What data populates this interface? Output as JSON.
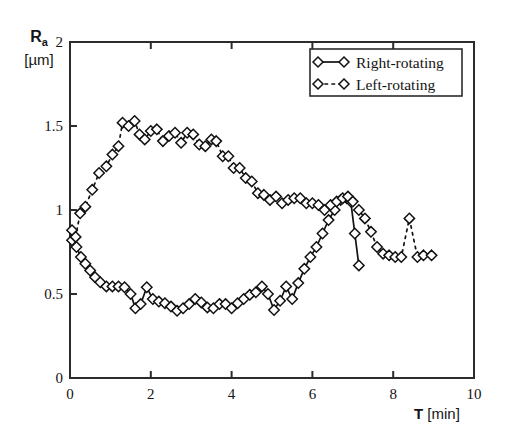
{
  "chart_data": {
    "type": "line",
    "title": "",
    "xlabel": "T [min]",
    "ylabel": "Ra [µm]",
    "ylabel_symbol": "R",
    "ylabel_subscript": "a",
    "ylabel_units": "[µm]",
    "xlabel_symbol": "T",
    "xlabel_units": "[min]",
    "xlim": [
      0,
      10
    ],
    "ylim": [
      0,
      2
    ],
    "xticks": [
      0,
      2,
      4,
      6,
      8,
      10
    ],
    "xtick_labels": [
      "0",
      "2",
      "4",
      "6",
      "8",
      "10"
    ],
    "yticks": [
      0,
      0.5,
      1,
      1.5,
      2
    ],
    "ytick_labels": [
      "0",
      "0.5",
      "1",
      "1.5",
      "2"
    ],
    "grid": false,
    "legend_position": "top-right",
    "marker": "diamond",
    "series": [
      {
        "name": "Right-rotating",
        "linestyle": "solid",
        "color": "#111111",
        "x": [
          0.05,
          0.16,
          0.27,
          0.38,
          0.5,
          0.62,
          0.75,
          0.9,
          1.05,
          1.2,
          1.35,
          1.5,
          1.62,
          1.75,
          1.9,
          2.05,
          2.2,
          2.35,
          2.5,
          2.65,
          2.8,
          2.95,
          3.1,
          3.25,
          3.4,
          3.55,
          3.7,
          3.85,
          4.0,
          4.15,
          4.3,
          4.45,
          4.6,
          4.75,
          4.9,
          5.05,
          5.2,
          5.35,
          5.5,
          5.65,
          5.8,
          5.95,
          6.1,
          6.25,
          6.4,
          6.55,
          6.7,
          6.85,
          6.95,
          7.05,
          7.15
        ],
        "y": [
          0.82,
          0.78,
          0.72,
          0.68,
          0.64,
          0.6,
          0.57,
          0.545,
          0.545,
          0.545,
          0.54,
          0.5,
          0.415,
          0.44,
          0.54,
          0.47,
          0.455,
          0.445,
          0.425,
          0.4,
          0.415,
          0.44,
          0.47,
          0.45,
          0.42,
          0.415,
          0.44,
          0.44,
          0.415,
          0.445,
          0.47,
          0.495,
          0.51,
          0.545,
          0.5,
          0.405,
          0.46,
          0.545,
          0.47,
          0.565,
          0.65,
          0.72,
          0.78,
          0.86,
          0.94,
          1.0,
          1.06,
          1.07,
          1.05,
          0.86,
          0.67
        ]
      },
      {
        "name": "Left-rotating",
        "linestyle": "dashed",
        "color": "#111111",
        "x": [
          0.05,
          0.14,
          0.25,
          0.38,
          0.55,
          0.72,
          0.9,
          1.05,
          1.2,
          1.3,
          1.45,
          1.6,
          1.72,
          1.85,
          2.0,
          2.15,
          2.3,
          2.45,
          2.6,
          2.75,
          2.9,
          3.05,
          3.2,
          3.35,
          3.5,
          3.62,
          3.78,
          3.92,
          4.05,
          4.2,
          4.35,
          4.5,
          4.65,
          4.8,
          4.95,
          5.1,
          5.25,
          5.4,
          5.55,
          5.7,
          5.85,
          6.0,
          6.15,
          6.3,
          6.45,
          6.6,
          6.75,
          6.88,
          7.0,
          7.15,
          7.3,
          7.45,
          7.6,
          7.75,
          7.9,
          8.05,
          8.2,
          8.4,
          8.6,
          8.75,
          8.95
        ],
        "y": [
          0.88,
          0.84,
          0.98,
          1.02,
          1.12,
          1.22,
          1.26,
          1.33,
          1.38,
          1.52,
          1.5,
          1.53,
          1.45,
          1.42,
          1.47,
          1.48,
          1.41,
          1.44,
          1.46,
          1.4,
          1.46,
          1.45,
          1.39,
          1.38,
          1.42,
          1.41,
          1.32,
          1.32,
          1.25,
          1.25,
          1.19,
          1.17,
          1.1,
          1.09,
          1.06,
          1.08,
          1.04,
          1.06,
          1.07,
          1.07,
          1.04,
          1.04,
          1.03,
          1.0,
          1.03,
          1.05,
          1.07,
          1.08,
          1.05,
          1.0,
          0.95,
          0.87,
          0.78,
          0.74,
          0.73,
          0.72,
          0.72,
          0.95,
          0.72,
          0.73,
          0.73
        ]
      }
    ],
    "legend_entries": [
      {
        "label": "Right-rotating",
        "linestyle": "solid",
        "marker": "diamond"
      },
      {
        "label": "Left-rotating",
        "linestyle": "dashed",
        "marker": "diamond"
      }
    ]
  }
}
